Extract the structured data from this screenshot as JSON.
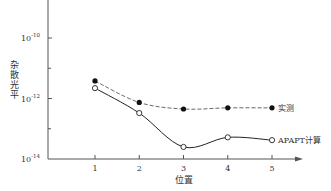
{
  "chart_data": {
    "type": "line",
    "title": "",
    "xlabel": "位置",
    "ylabel": "杂散光平",
    "yscale": "log",
    "ylim": [
      1e-14,
      1e-09
    ],
    "x": [
      1,
      2,
      3,
      4,
      5
    ],
    "x_ticks": [
      "1",
      "2",
      "3",
      "4",
      "5"
    ],
    "y_ticks": [
      {
        "value": 1e-10,
        "base": "10",
        "exp": "-10"
      },
      {
        "value": 1e-12,
        "base": "10",
        "exp": "-12"
      },
      {
        "value": 1e-14,
        "base": "10",
        "exp": "-14"
      }
    ],
    "y_minor_ticks": [
      1e-11,
      1e-13
    ],
    "grid": false,
    "legend_position": "inline-right",
    "series": [
      {
        "name": "实测",
        "marker": "filled-circle",
        "line": "dashed",
        "values": [
          3.8e-12,
          7.4e-13,
          4.5e-13,
          4.9e-13,
          4.9e-13
        ]
      },
      {
        "name": "APAPT计算",
        "marker": "open-circle",
        "line": "solid-smooth",
        "values": [
          2.2e-12,
          3.3e-13,
          2.5e-14,
          5.2e-14,
          4.2e-14
        ]
      }
    ]
  },
  "colors": {
    "axis": "#555555",
    "line": "#222222",
    "text": "#333333"
  }
}
